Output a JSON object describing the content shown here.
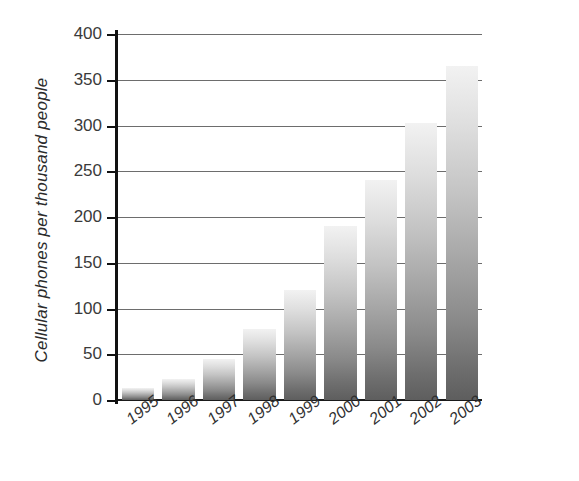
{
  "chart_data": {
    "type": "bar",
    "title": "",
    "subtitle": "",
    "xlabel": "",
    "ylabel": "Cellular phones per thousand people",
    "categories": [
      "1995",
      "1996",
      "1997",
      "1998",
      "1999",
      "2000",
      "2001",
      "2002",
      "2003"
    ],
    "values": [
      13,
      23,
      45,
      78,
      120,
      190,
      241,
      303,
      365
    ],
    "ylim": [
      0,
      400
    ],
    "ytick_values": [
      0,
      50,
      100,
      150,
      200,
      250,
      300,
      350,
      400
    ],
    "ytick_labels": [
      "0",
      "50",
      "100",
      "150",
      "200",
      "250",
      "300",
      "350",
      "400"
    ],
    "grid": true,
    "legend": false,
    "legend_position": "none",
    "series": [
      {
        "name": "Cellular phones per thousand people",
        "values": [
          13,
          23,
          45,
          78,
          120,
          190,
          241,
          303,
          365
        ]
      }
    ],
    "bar_fill_top_color": "#f2f2f2",
    "bar_fill_bottom_color": "#5e5e5e",
    "gridline_color": "#6d6d6d",
    "axis_color": "#111111",
    "background_color": "#ffffff",
    "text_color": "#2f2f2f"
  },
  "axes": {
    "y_title": "Cellular phones per thousand people"
  }
}
